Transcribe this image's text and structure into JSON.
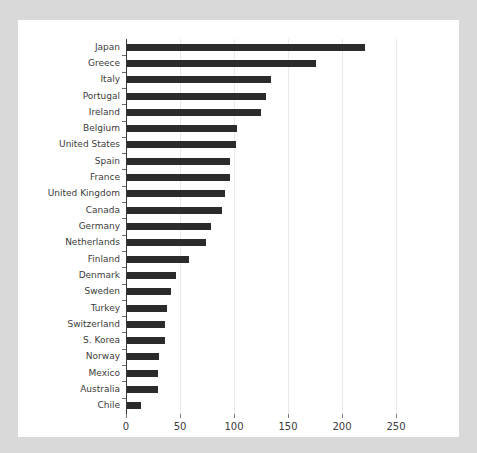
{
  "chart_data": {
    "type": "bar",
    "orientation": "horizontal",
    "title": "",
    "subtitle": "",
    "xlabel": "",
    "ylabel": "",
    "xlim": [
      0,
      275
    ],
    "ylim": null,
    "grid": true,
    "grid_axis": "x",
    "legend": null,
    "legend_position": "none",
    "xticks": [
      0,
      50,
      100,
      150,
      200,
      250
    ],
    "xtick_labels": [
      "0",
      "50",
      "100",
      "150",
      "200",
      "250"
    ],
    "categories": [
      "Japan",
      "Greece",
      "Italy",
      "Portugal",
      "Ireland",
      "Belgium",
      "United States",
      "Spain",
      "France",
      "United Kingdom",
      "Canada",
      "Germany",
      "Netherlands",
      "Finland",
      "Denmark",
      "Sweden",
      "Turkey",
      "Switzerland",
      "S. Korea",
      "Norway",
      "Mexico",
      "Australia",
      "Chile"
    ],
    "values": [
      220,
      175,
      133,
      129,
      124,
      102,
      101,
      95,
      95,
      91,
      88,
      78,
      73,
      57,
      45,
      41,
      37,
      35,
      35,
      30,
      29,
      29,
      13
    ],
    "bar_color": "#2b2b2b",
    "background_color": "#ffffff",
    "figure_background_color": "#d9d9d9",
    "gridline_color": "#e9e9e9",
    "axis_color": "#3a3a3a",
    "tick_label_color": "#3c3c3c"
  }
}
